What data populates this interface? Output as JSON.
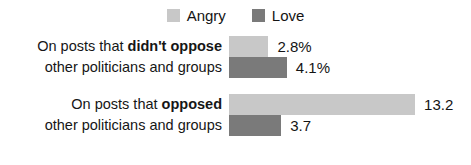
{
  "colors": {
    "angry": "#c8c8c8",
    "love": "#7a7a7a",
    "text": "#141414",
    "background": "#ffffff"
  },
  "legend": {
    "position": "top-center",
    "entries": [
      {
        "label": "Angry",
        "swatch_name": "legend-swatch-angry",
        "color": "#c8c8c8"
      },
      {
        "label": "Love",
        "swatch_name": "legend-swatch-love",
        "color": "#7a7a7a"
      }
    ]
  },
  "groups": [
    {
      "label_line1_lead": "On posts that ",
      "label_line1_emph": "didn't oppose",
      "label_line2": "other politicians and groups",
      "bars": [
        {
          "series": "Angry",
          "value": 2.8,
          "value_label": "2.8%",
          "color": "#c8c8c8"
        },
        {
          "series": "Love",
          "value": 4.1,
          "value_label": "4.1%",
          "color": "#7a7a7a"
        }
      ]
    },
    {
      "label_line1_lead": "On posts that ",
      "label_line1_emph": "opposed",
      "label_line2": "other politicians and groups",
      "bars": [
        {
          "series": "Angry",
          "value": 13.2,
          "value_label": "13.2",
          "color": "#c8c8c8"
        },
        {
          "series": "Love",
          "value": 3.7,
          "value_label": "3.7",
          "color": "#7a7a7a"
        }
      ]
    }
  ],
  "chart_data": {
    "type": "bar",
    "orientation": "horizontal",
    "title": "",
    "subtitle": "",
    "xlabel": "",
    "ylabel": "",
    "grid": false,
    "legend_position": "top-center",
    "categories": [
      "On posts that didn't oppose other politicians and groups",
      "On posts that opposed other politicians and groups"
    ],
    "series": [
      {
        "name": "Angry",
        "color": "#c8c8c8",
        "values": [
          2.8,
          13.2
        ],
        "value_labels": [
          "2.8%",
          "13.2"
        ]
      },
      {
        "name": "Love",
        "color": "#7a7a7a",
        "values": [
          4.1,
          3.7
        ],
        "value_labels": [
          "4.1%",
          "3.7"
        ]
      }
    ],
    "xlim": [
      0,
      13.2
    ],
    "annotations": [],
    "pixels_per_unit": 14.1,
    "bar_origin_x_px": 229
  }
}
